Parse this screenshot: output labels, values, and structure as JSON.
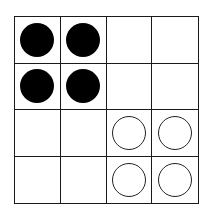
{
  "board": {
    "rows": 4,
    "cols": 4,
    "cells": [
      [
        "black",
        "black",
        "empty",
        "empty"
      ],
      [
        "black",
        "black",
        "empty",
        "empty"
      ],
      [
        "empty",
        "empty",
        "white",
        "white"
      ],
      [
        "empty",
        "empty",
        "white",
        "white"
      ]
    ]
  },
  "colors": {
    "line": "#1a1a1a",
    "black_piece": "#000000",
    "white_piece": "#ffffff"
  }
}
